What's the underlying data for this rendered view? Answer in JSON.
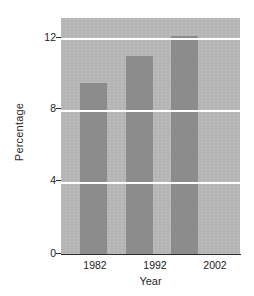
{
  "chart_data": {
    "type": "bar",
    "title": "",
    "subtitle": "",
    "xlabel": "Year",
    "ylabel": "Percentage",
    "categories": [
      "1982",
      "1992",
      "2002"
    ],
    "values": [
      9.5,
      11.0,
      12.1
    ],
    "series": [
      {
        "name": "Percentage",
        "values": [
          9.5,
          11.0,
          12.1
        ]
      }
    ],
    "ylim": [
      0,
      13.1
    ],
    "yticks": [
      0,
      4,
      8,
      12
    ],
    "ytick_labels": [
      "0",
      "4",
      "8",
      "12"
    ],
    "xticks": [
      "1982",
      "1992",
      "2002"
    ],
    "gridlines": {
      "horizontal": true,
      "vertical": false,
      "values": [
        4,
        8,
        12
      ],
      "color": "#fdfdfd"
    },
    "legend": {
      "present": false,
      "position": "none",
      "entries": []
    },
    "annotations": [],
    "colors": {
      "bar_fill": "#8c8c8c",
      "plot_background": "#b9b9b9",
      "gridline": "#fdfdfd",
      "axis_line": "#2b2b2b",
      "text": "#1c1c1c",
      "figure_background": "#ffffff"
    }
  },
  "axes": {
    "y_title": "Percentage",
    "x_title": "Year",
    "y_tick_labels": [
      "12",
      "8",
      "4",
      "0"
    ],
    "x_tick_labels": [
      "1982",
      "1992",
      "2002"
    ]
  }
}
